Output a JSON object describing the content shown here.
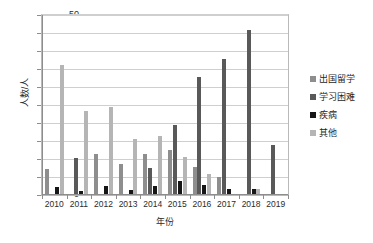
{
  "chart_data": {
    "type": "bar",
    "title": "",
    "xlabel": "年份",
    "ylabel": "人数/人",
    "ylim": [
      0,
      50
    ],
    "ystep": 5,
    "ytick_labels": [
      "50",
      "45",
      "40",
      "35",
      "30",
      "25",
      "20",
      "15",
      "10",
      "5",
      "0"
    ],
    "grid": true,
    "legend_position": "right",
    "categories": [
      "2010",
      "2011",
      "2012",
      "2013",
      "2014",
      "2015",
      "2016",
      "2017",
      "2018",
      "2019"
    ],
    "series": [
      {
        "name": "出国留学",
        "color": "#8e8e8e",
        "values": [
          7.0,
          0,
          11.0,
          8.2,
          11.1,
          12.3,
          7.4,
          4.6,
          0,
          0
        ]
      },
      {
        "name": "学习困难",
        "color": "#595959",
        "values": [
          0,
          10.1,
          0,
          0,
          7.2,
          19.3,
          32.4,
          37.4,
          45.5,
          13.7
        ]
      },
      {
        "name": "疾病",
        "color": "#161616",
        "values": [
          2.0,
          0.9,
          2.1,
          1.1,
          2.2,
          3.5,
          2.4,
          1.3,
          1.3,
          0
        ]
      },
      {
        "name": "其他",
        "color": "#b5b5b5",
        "values": [
          35.8,
          23.1,
          24.2,
          15.2,
          16.0,
          10.4,
          5.6,
          0,
          1.4,
          0
        ]
      }
    ]
  },
  "legend": {
    "items": [
      {
        "label": "出国留学",
        "color": "#8e8e8e"
      },
      {
        "label": "学习困难",
        "color": "#595959"
      },
      {
        "label": "疾病",
        "color": "#161616"
      },
      {
        "label": "其他",
        "color": "#b5b5b5"
      }
    ]
  }
}
